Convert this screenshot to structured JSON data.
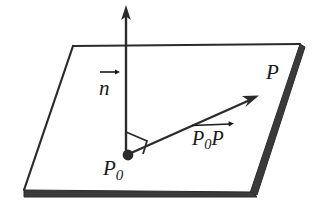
{
  "figure": {
    "background_color": "#ffffff",
    "ink_color": "#2b2b2b",
    "slab_color": "#3a3a3a",
    "labels": {
      "normal_vector": "n",
      "point_p": "P",
      "point_p0_base": "P",
      "point_p0_subscript": "0",
      "displacement_vector_base": "P",
      "displacement_vector_subscript": "0",
      "displacement_vector_head": "P"
    },
    "geometry": {
      "plane_corners": {
        "top_left": [
          73,
          46
        ],
        "top_right": [
          300,
          44
        ],
        "bottom_right": [
          252,
          192
        ],
        "bottom_left": [
          24,
          190
        ]
      },
      "point_p0": [
        128,
        155
      ],
      "normal_arrow_start": [
        126,
        155
      ],
      "normal_arrow_tip": [
        126,
        6
      ],
      "vector_arrow_start": [
        131,
        153
      ],
      "vector_arrow_tip": [
        258,
        96
      ],
      "right_angle_marker": true
    }
  }
}
